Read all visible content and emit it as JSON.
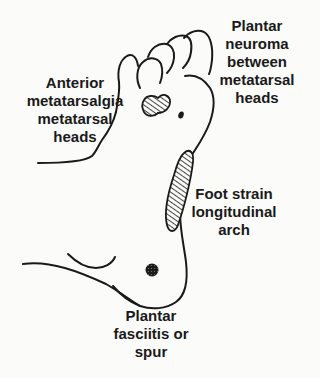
{
  "colors": {
    "background": "#fbfbf9",
    "ink": "#1a1a1a"
  },
  "labels": {
    "plantar_neuroma": "Plantar\nneuroma\nbetween\nmetatarsal\nheads",
    "anterior_metatarsalgia": "Anterior\nmetatarsalgia\nmetatarsal\nheads",
    "foot_strain": "Foot strain\nlongitudinal\narch",
    "plantar_fasciitis": "Plantar\nfasciitis or\nspur"
  },
  "regions": [
    {
      "name": "metatarsal-heads",
      "pattern": "hatched"
    },
    {
      "name": "neuroma-spot",
      "pattern": "solid"
    },
    {
      "name": "longitudinal-arch",
      "pattern": "hatched"
    },
    {
      "name": "heel-spur",
      "pattern": "stippled"
    }
  ]
}
